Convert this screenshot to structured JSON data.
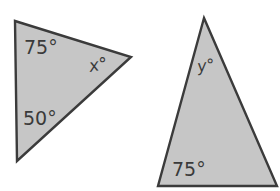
{
  "figure": {
    "background_color": "#ffffff",
    "shape_fill_color": "#c6c6c6",
    "shape_stroke_color": "#3b3b3b",
    "label_color": "#3a3a3a",
    "shapes": [
      {
        "name": "left-triangle",
        "kind": "triangle",
        "vertices": [
          [
            15,
            21
          ],
          [
            131,
            57
          ],
          [
            17,
            161
          ]
        ],
        "labels": [
          {
            "name": "angle-75-left-triangle",
            "text": "75°",
            "value": 75,
            "unit": "degrees",
            "x": 24,
            "y": 54,
            "style": "numeric"
          },
          {
            "name": "angle-50-left-triangle",
            "text": "50°",
            "value": 50,
            "unit": "degrees",
            "x": 23,
            "y": 125,
            "style": "numeric"
          },
          {
            "name": "angle-x-left-triangle",
            "text": "x°",
            "value": "x",
            "unit": "degrees",
            "x": 90,
            "y": 72,
            "style": "variable"
          }
        ]
      },
      {
        "name": "right-triangle",
        "kind": "triangle",
        "vertices": [
          [
            204,
            18
          ],
          [
            277,
            186
          ],
          [
            158,
            186
          ]
        ],
        "labels": [
          {
            "name": "angle-y-right-triangle",
            "text": "y°",
            "value": "y",
            "unit": "degrees",
            "x": 198,
            "y": 72,
            "style": "variable"
          },
          {
            "name": "angle-75-right-triangle",
            "text": "75°",
            "value": 75,
            "unit": "degrees",
            "x": 172,
            "y": 176,
            "style": "numeric"
          }
        ]
      }
    ]
  }
}
